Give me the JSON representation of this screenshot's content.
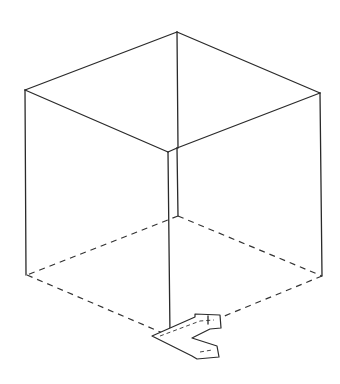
{
  "diagram": {
    "title": "",
    "colors": {
      "background": "#ffffff",
      "line": "#2a2a2a"
    },
    "cube": {
      "top_face": {
        "apex": [
          177,
          32
        ],
        "left": [
          25,
          90
        ],
        "right": [
          320,
          93
        ],
        "front": [
          168,
          152
        ],
        "front_offset": [
          177,
          148
        ]
      },
      "bottom_face": {
        "back": [
          177,
          216
        ],
        "left": [
          27,
          275
        ],
        "right": [
          322,
          276
        ],
        "front": [
          170,
          336
        ]
      },
      "bottom_face_style": "dashed"
    },
    "arrow_shape": {
      "type": "3d-chevron-bracket",
      "position": [
        150,
        315
      ],
      "direction": "right-pointing open bracket"
    }
  }
}
